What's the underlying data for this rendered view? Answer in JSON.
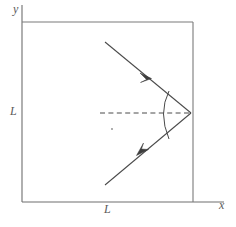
{
  "figure": {
    "background_color": "#ffffff",
    "line_color": "#5a5a5a",
    "ray_color": "#4a4a4a",
    "axes": {
      "x_label": "x",
      "y_label": "y",
      "origin": [
        22,
        202
      ],
      "x_axis_end": [
        222,
        202
      ],
      "y_axis_top": [
        22,
        5
      ]
    },
    "labels": {
      "side_left": "L",
      "side_bottom": "L"
    },
    "square": {
      "name": "cavity-boundary",
      "left": 22,
      "top": 22,
      "right": 193,
      "bottom": 202,
      "side_label": "L"
    },
    "vertex": {
      "name": "reflection-point",
      "x": 191,
      "y": 113
    },
    "incoming_ray": {
      "name": "incident-ray",
      "from": [
        105,
        42
      ],
      "to": [
        191,
        113
      ],
      "arrow_at": [
        146,
        74
      ],
      "direction": "down-right"
    },
    "outgoing_ray": {
      "name": "reflected-ray",
      "from": [
        191,
        113
      ],
      "to": [
        105,
        185
      ],
      "arrow_at": [
        144,
        151
      ],
      "direction": "down-left"
    },
    "normal_line": {
      "name": "surface-normal-dashed",
      "from": [
        100,
        113
      ],
      "to": [
        191,
        113
      ],
      "style": "dashed"
    },
    "angle_arc": {
      "name": "reflection-angle-arc",
      "start": [
        168,
        92
      ],
      "end": [
        168,
        138
      ],
      "bulge_x": 160
    },
    "center_dot": {
      "name": "center-mark",
      "x": 112,
      "y": 129
    }
  }
}
